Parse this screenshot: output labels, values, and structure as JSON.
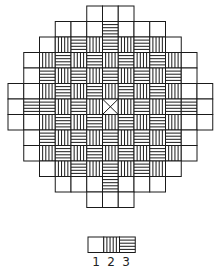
{
  "figure": {
    "grid_origin": [
      8,
      6
    ],
    "cell_w": 15.75,
    "cell_h": 15.5,
    "stroke_color": "#1a1a1a",
    "legend_codes": {
      "E": 1,
      "V": 2,
      "H": 3,
      "X": "center"
    },
    "rows": [
      {
        "start": 5,
        "cells": "EEE"
      },
      {
        "start": 3,
        "cells": "EEEHEEE"
      },
      {
        "start": 2,
        "cells": "EVHVHVHVE"
      },
      {
        "start": 1,
        "cells": "EVHVHVHVHVE"
      },
      {
        "start": 1,
        "cells": "EHVHVHVHVHE"
      },
      {
        "start": 0,
        "cells": "EEVHVHVHVHVEE"
      },
      {
        "start": 0,
        "cells": "EHHVHVXVHVHHE"
      },
      {
        "start": 0,
        "cells": "EEVHVHVHVHVEE"
      },
      {
        "start": 1,
        "cells": "EHVHVHVHVHE"
      },
      {
        "start": 1,
        "cells": "EVHVHVHVHVE"
      },
      {
        "start": 2,
        "cells": "EVHVHVHVE"
      },
      {
        "start": 3,
        "cells": "EEEHEEE"
      },
      {
        "start": 5,
        "cells": "EEE"
      }
    ]
  },
  "legend": {
    "origin": [
      88,
      237
    ],
    "cells": [
      "E",
      "V",
      "H"
    ],
    "labels": [
      "1",
      "2",
      "3"
    ]
  }
}
